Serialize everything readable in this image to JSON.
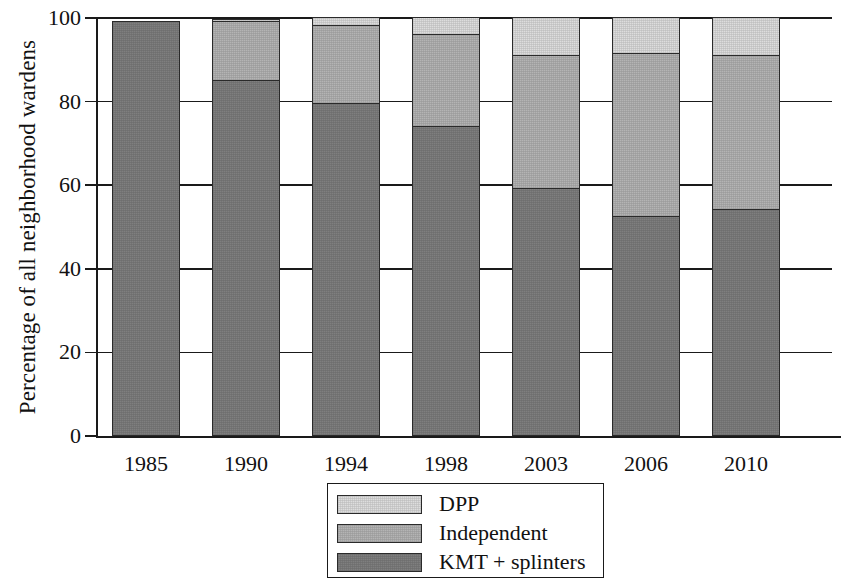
{
  "chart_data": {
    "type": "bar",
    "subtype": "stacked-bar-percent",
    "title": "",
    "xlabel": "",
    "ylabel": "Percentage of all neighborhood wardens",
    "categories": [
      "1985",
      "1990",
      "1994",
      "1998",
      "2003",
      "2006",
      "2010"
    ],
    "ylim": [
      0,
      100
    ],
    "yticks": [
      0,
      20,
      40,
      60,
      80,
      100
    ],
    "ytick_labels": [
      "0",
      "20",
      "40",
      "60",
      "80",
      "100"
    ],
    "grid": true,
    "legend_position": "bottom-center",
    "stack_order_bottom_to_top": [
      "KMT + splinters",
      "Independent",
      "DPP"
    ],
    "series": [
      {
        "name": "KMT + splinters",
        "color": "#7f7f7f",
        "values": [
          99,
          85,
          79.5,
          74,
          59,
          52.5,
          54
        ]
      },
      {
        "name": "Independent",
        "color": "#b4b4b4",
        "values": [
          0,
          14,
          18.5,
          22,
          32,
          39,
          37
        ]
      },
      {
        "name": "DPP",
        "color": "#dddddd",
        "values": [
          0,
          0.5,
          2,
          4,
          9,
          8.5,
          9
        ]
      }
    ]
  },
  "legend": {
    "entries": [
      {
        "label": "DPP",
        "color": "#dddddd"
      },
      {
        "label": "Independent",
        "color": "#b4b4b4"
      },
      {
        "label": "KMT + splinters",
        "color": "#7f7f7f"
      }
    ]
  }
}
